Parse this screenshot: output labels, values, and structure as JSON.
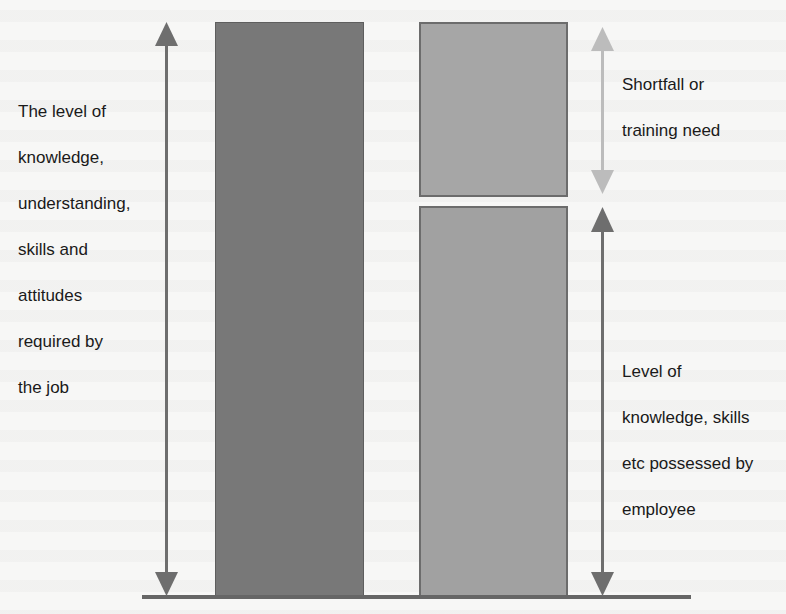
{
  "diagram": {
    "type": "training-needs-gap",
    "labels": {
      "required": {
        "lines": [
          "The level of",
          "knowledge,",
          "understanding,",
          "skills and",
          "attitudes",
          "required by",
          "the job"
        ]
      },
      "shortfall": {
        "lines": [
          "Shortfall or",
          "training need"
        ]
      },
      "possessed": {
        "lines": [
          "Level of",
          "knowledge, skills",
          "etc possessed by",
          "employee"
        ]
      }
    },
    "bars": [
      {
        "id": "required",
        "description": "Required level bar",
        "color": "#787878",
        "relative_height": 1.0
      },
      {
        "id": "possessed",
        "description": "Possessed level bar",
        "color": "#a1a1a1",
        "relative_height": 0.68
      },
      {
        "id": "shortfall",
        "description": "Shortfall / gap box",
        "color": "#a6a6a6",
        "relative_height": 0.3
      }
    ],
    "arrows": [
      {
        "id": "required-arrow",
        "direction": "double-vertical",
        "color": "#6e6e6e"
      },
      {
        "id": "shortfall-arrow",
        "direction": "double-vertical",
        "color": "#bcbcbc"
      },
      {
        "id": "possessed-arrow",
        "direction": "double-vertical",
        "color": "#6e6e6e"
      }
    ],
    "colors": {
      "background": "#f7f7f6",
      "text": "#1a1a1a",
      "baseline": "#666666"
    }
  }
}
